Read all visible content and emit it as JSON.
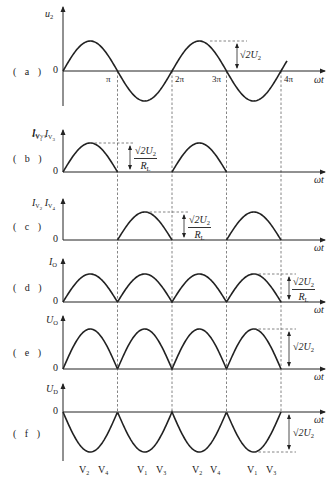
{
  "figure": {
    "panels": [
      {
        "id": "a",
        "label": "( a )",
        "y_axis": "u",
        "y_sub": "2",
        "waveform": "sine",
        "amplitude_label": "√2U₂"
      },
      {
        "id": "b",
        "label": "( b )",
        "y_axis": "I",
        "y_sub": "V1 V3",
        "waveform": "half-wave positive (odd half-cycles)",
        "amplitude_label": "√2U₂ / R_L"
      },
      {
        "id": "c",
        "label": "( c )",
        "y_axis": "I",
        "y_sub": "V2 V4",
        "waveform": "half-wave positive (even half-cycles)",
        "amplitude_label": "√2U₂ / R_L"
      },
      {
        "id": "d",
        "label": "( d )",
        "y_axis": "I",
        "y_sub": "O",
        "waveform": "full-wave rectified",
        "amplitude_label": "√2U₂ / R_L"
      },
      {
        "id": "e",
        "label": "( e )",
        "y_axis": "U",
        "y_sub": "O",
        "waveform": "full-wave rectified",
        "amplitude_label": "√2U₂"
      },
      {
        "id": "f",
        "label": "( f )",
        "y_axis": "U",
        "y_sub": "D",
        "waveform": "negative full-wave (diode reverse voltage)",
        "amplitude_label": "√2U₂"
      }
    ],
    "labels": {
      "pa": "( a )",
      "pb": "( b )",
      "pc": "( c )",
      "pd": "( d )",
      "pe": "( e )",
      "pf": "( f )",
      "zero": "0",
      "pi": "π",
      "two_pi": "2π",
      "three_pi": "3π",
      "four_pi": "4π",
      "omega_t": "ωt",
      "u": "u",
      "u_sub": "2",
      "I": "I",
      "U": "U",
      "V1": "V1",
      "V3": "V3",
      "V2": "V2",
      "V4": "V4",
      "sub_O": "O",
      "sub_D": "D",
      "root2U2": "√2U",
      "two": "2",
      "RL": "R",
      "L": "L"
    },
    "x_ticks": [
      "π",
      "2π",
      "3π",
      "4π"
    ],
    "x_axis_label": "ωt",
    "diode_conduction_labels": [
      {
        "v": "V",
        "sub": "2"
      },
      {
        "v": "V",
        "sub": "4"
      },
      {
        "v": "V",
        "sub": "1"
      },
      {
        "v": "V",
        "sub": "3"
      },
      {
        "v": "V",
        "sub": "2"
      },
      {
        "v": "V",
        "sub": "4"
      },
      {
        "v": "V",
        "sub": "1"
      },
      {
        "v": "V",
        "sub": "3"
      }
    ],
    "colors": {
      "stroke": "#222222",
      "dash": "#555555",
      "background": "#ffffff"
    }
  }
}
